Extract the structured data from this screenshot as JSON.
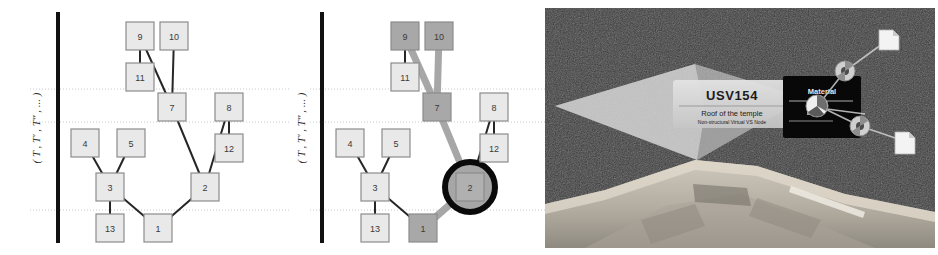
{
  "figure": {
    "panels": [
      {
        "id": "panel-a",
        "name": "tree-baseline"
      },
      {
        "id": "panel-b",
        "name": "tree-highlighted"
      },
      {
        "id": "panel-c",
        "name": "ar-scene"
      }
    ]
  },
  "tree": {
    "axis_label": "( T , T′ , T″ , ... )",
    "axis_label_plain": "(T, T', T'', ...)",
    "node_labels": [
      "1",
      "2",
      "3",
      "4",
      "5",
      "7",
      "8",
      "9",
      "10",
      "11",
      "12",
      "13"
    ],
    "nodes": [
      {
        "id": "1",
        "label": "1",
        "x": 158,
        "y": 228
      },
      {
        "id": "2",
        "label": "2",
        "x": 205,
        "y": 187
      },
      {
        "id": "3",
        "label": "3",
        "x": 110,
        "y": 187
      },
      {
        "id": "4",
        "label": "4",
        "x": 85,
        "y": 143
      },
      {
        "id": "5",
        "label": "5",
        "x": 131,
        "y": 143
      },
      {
        "id": "7",
        "label": "7",
        "x": 172,
        "y": 107
      },
      {
        "id": "8",
        "label": "8",
        "x": 229,
        "y": 107
      },
      {
        "id": "9",
        "label": "9",
        "x": 140,
        "y": 36
      },
      {
        "id": "10",
        "label": "10",
        "x": 174,
        "y": 36
      },
      {
        "id": "11",
        "label": "11",
        "x": 140,
        "y": 77
      },
      {
        "id": "12",
        "label": "12",
        "x": 229,
        "y": 148
      },
      {
        "id": "13",
        "label": "13",
        "x": 110,
        "y": 228
      }
    ],
    "edges": [
      {
        "from": "1",
        "to": "3"
      },
      {
        "from": "1",
        "to": "2"
      },
      {
        "from": "3",
        "to": "4"
      },
      {
        "from": "3",
        "to": "5"
      },
      {
        "from": "3",
        "to": "13"
      },
      {
        "from": "2",
        "to": "7"
      },
      {
        "from": "2",
        "to": "8"
      },
      {
        "from": "8",
        "to": "12"
      },
      {
        "from": "7",
        "to": "9"
      },
      {
        "from": "7",
        "to": "10"
      },
      {
        "from": "9",
        "to": "11"
      }
    ],
    "gridlines_y": [
      89,
      122,
      210
    ],
    "axis_bar": {
      "x": 58,
      "y_top": 12,
      "y_bottom": 243,
      "width": 4
    },
    "highlight": {
      "nodes": [
        "1",
        "2",
        "7",
        "9",
        "10"
      ],
      "edges": [
        {
          "from": "1",
          "to": "2"
        },
        {
          "from": "2",
          "to": "7"
        },
        {
          "from": "7",
          "to": "9"
        },
        {
          "from": "7",
          "to": "10"
        }
      ],
      "selected_node": "2",
      "selection_marker": "circle"
    }
  },
  "colors": {
    "node_fill": "#e9e9e9",
    "node_fill_highlight": "#a8a8a8",
    "node_stroke": "#8c8c8c",
    "node_text": "#3a3a3a",
    "edge": "#262626",
    "edge_highlight": "#9a9a9a",
    "gridline": "#c8c8d6",
    "axis_bar": "#111111",
    "selection_ring": "#0a0a0a",
    "ar_background": "#3b3b3b",
    "ar_panel_fill": "#d8d8d8",
    "ar_plane_light": "#c9c9c9",
    "ar_plane_dark": "#9a9a9a",
    "ar_stone": "#b5b0a6",
    "ar_black_panel": "#090909",
    "ar_doc_icon": "#f2f2f2"
  },
  "ar_scene": {
    "info_card": {
      "title": "USV154",
      "subtitle": "Roof of the temple",
      "meta": "Non-structural Virtual VS Node"
    },
    "property_panel": {
      "title": "Material"
    },
    "graph_icons": [
      {
        "name": "node-disc-upper",
        "type": "disc",
        "x": 300,
        "y": 63
      },
      {
        "name": "node-disc-center",
        "type": "disc-sel",
        "x": 272,
        "y": 98
      },
      {
        "name": "node-disc-lower",
        "type": "disc",
        "x": 315,
        "y": 118
      },
      {
        "name": "doc-icon-upper",
        "type": "document",
        "x": 340,
        "y": 30
      },
      {
        "name": "doc-icon-lower",
        "type": "document",
        "x": 355,
        "y": 130
      }
    ]
  }
}
